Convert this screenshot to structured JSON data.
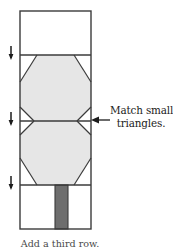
{
  "figure": {
    "colors": {
      "outline": "#3b3b3b",
      "panel_white": "#ffffff",
      "octagon_fill": "#e6e6e6",
      "strip_dark": "#6e6e6e",
      "text": "#1b1b1b",
      "caption_text": "#4a4a4a",
      "background": "#ffffff"
    },
    "rect": {
      "left": 20,
      "right": 91,
      "top": 11,
      "bottom": 229,
      "width": 71,
      "height": 218
    },
    "seams": [
      {
        "name": "upper-seam",
        "y": 55
      },
      {
        "name": "middle-seam",
        "y": 121
      },
      {
        "name": "lower-seam",
        "y": 185
      }
    ],
    "tick_marks": [
      {
        "name": "seam-tick-upper",
        "x": 11,
        "y": 55
      },
      {
        "name": "seam-tick-middle",
        "x": 11,
        "y": 121
      },
      {
        "name": "seam-tick-lower",
        "x": 11,
        "y": 185
      }
    ],
    "small_triangles": [
      {
        "name": "left-small-triangle",
        "side": "left"
      },
      {
        "name": "right-small-triangle",
        "side": "right"
      }
    ],
    "dark_strip": {
      "left": 55,
      "right": 68,
      "top": 185,
      "bottom": 229
    }
  },
  "callout": {
    "line1": "Match small",
    "line2": "triangles.",
    "arrow": "left-arrow"
  },
  "bottom_caption": {
    "text": "Add a third row."
  }
}
